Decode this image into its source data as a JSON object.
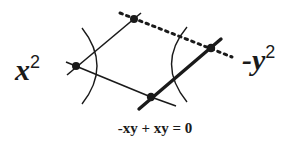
{
  "diagram": {
    "left_label": {
      "base": "x",
      "exponent": "2"
    },
    "right_label": {
      "prefix": "-",
      "base": "y",
      "exponent": "2"
    },
    "equation": "-xy + xy = 0",
    "vertices": {
      "left": [
        76,
        66
      ],
      "top": [
        134,
        19
      ],
      "right": [
        211,
        48
      ],
      "bottom": [
        151,
        97
      ]
    },
    "edges": [
      {
        "from": "left",
        "to": "top",
        "style": "thin-solid"
      },
      {
        "from": "left",
        "to": "bottom",
        "style": "thin-solid"
      },
      {
        "from": "top",
        "to": "right",
        "style": "dotted"
      },
      {
        "from": "bottom",
        "to": "right",
        "style": "thick-solid"
      }
    ],
    "arcs": [
      {
        "side": "left",
        "bulge": "right"
      },
      {
        "side": "right",
        "bulge": "left"
      }
    ],
    "colors": {
      "ink": "#1a1a1a",
      "background": "#ffffff"
    }
  }
}
